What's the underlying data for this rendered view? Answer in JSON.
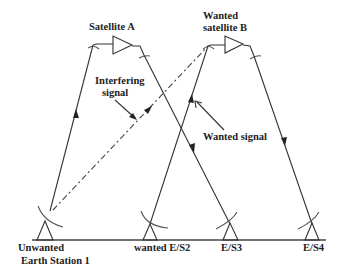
{
  "diagram": {
    "satellites": [
      {
        "id": "sat-a",
        "label_lines": [
          "Satellite A"
        ]
      },
      {
        "id": "sat-b",
        "label_lines": [
          "Wanted",
          "satellite B"
        ]
      }
    ],
    "earth_stations": [
      {
        "id": "es1",
        "label_lines": [
          "Unwanted",
          "Earth Station 1"
        ]
      },
      {
        "id": "es2",
        "label_lines": [
          "wanted E/S2"
        ]
      },
      {
        "id": "es3",
        "label_lines": [
          "E/S3"
        ]
      },
      {
        "id": "es4",
        "label_lines": [
          "E/S4"
        ]
      }
    ],
    "annotations": {
      "interfering_signal": [
        "Interfering",
        "signal"
      ],
      "wanted_signal": "Wanted signal"
    },
    "links": [
      {
        "from": "es1",
        "to": "sat-a",
        "style": "solid",
        "direction": "uplink"
      },
      {
        "from": "sat-a",
        "to": "es3",
        "style": "solid",
        "direction": "downlink"
      },
      {
        "from": "es1",
        "to": "sat-b",
        "style": "dash-dot",
        "direction": "uplink",
        "meaning": "interfering"
      },
      {
        "from": "es2",
        "to": "sat-b",
        "style": "solid",
        "direction": "uplink",
        "meaning": "wanted"
      },
      {
        "from": "sat-b",
        "to": "es4",
        "style": "solid",
        "direction": "downlink"
      }
    ],
    "colors": {
      "line": "#333333",
      "background": "#ffffff",
      "text": "#222222"
    }
  }
}
